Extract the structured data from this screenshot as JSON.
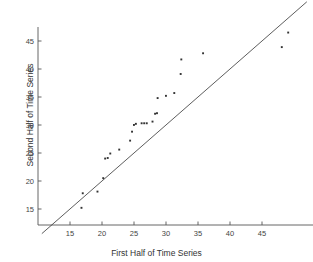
{
  "chart_data": {
    "type": "scatter",
    "title": "",
    "xlabel": "First Half of Time Series",
    "ylabel": "Second Half of Time Series",
    "xlim": [
      10,
      53
    ],
    "ylim": [
      11.8,
      47.5
    ],
    "xticks": [
      15,
      20,
      25,
      30,
      35,
      40,
      45
    ],
    "yticks": [
      15,
      20,
      25,
      30,
      35,
      40,
      45
    ],
    "grid": false,
    "legend": null,
    "marker": "dot",
    "marker_color": "#333333",
    "reference_line": {
      "name": "identity-line",
      "type": "line",
      "slope": 1,
      "intercept": 0,
      "x": [
        10.6,
        52.0
      ],
      "y": [
        10.6,
        52.0
      ],
      "color": "#333333",
      "width": 0.8
    },
    "points": [
      {
        "x": 16.8,
        "y": 15.2
      },
      {
        "x": 17.0,
        "y": 17.8
      },
      {
        "x": 19.3,
        "y": 18.1
      },
      {
        "x": 20.2,
        "y": 20.5
      },
      {
        "x": 20.5,
        "y": 24.0
      },
      {
        "x": 20.9,
        "y": 24.1
      },
      {
        "x": 21.3,
        "y": 24.9
      },
      {
        "x": 22.7,
        "y": 25.6
      },
      {
        "x": 24.4,
        "y": 27.2
      },
      {
        "x": 24.7,
        "y": 28.8
      },
      {
        "x": 25.0,
        "y": 30.0
      },
      {
        "x": 25.3,
        "y": 30.2
      },
      {
        "x": 26.2,
        "y": 30.3
      },
      {
        "x": 26.6,
        "y": 30.3
      },
      {
        "x": 27.0,
        "y": 30.3
      },
      {
        "x": 27.9,
        "y": 30.6
      },
      {
        "x": 28.3,
        "y": 32.0
      },
      {
        "x": 28.6,
        "y": 32.1
      },
      {
        "x": 28.7,
        "y": 34.8
      },
      {
        "x": 30.0,
        "y": 35.2
      },
      {
        "x": 31.3,
        "y": 35.7
      },
      {
        "x": 32.3,
        "y": 39.1
      },
      {
        "x": 32.4,
        "y": 41.7
      },
      {
        "x": 35.8,
        "y": 42.8
      },
      {
        "x": 48.1,
        "y": 43.9
      },
      {
        "x": 49.1,
        "y": 46.5
      }
    ],
    "axes": {
      "x_axis_line": true,
      "y_axis_line": true,
      "top_spine": false,
      "right_spine": false
    }
  }
}
